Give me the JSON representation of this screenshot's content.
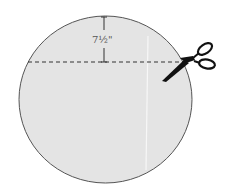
{
  "diagram": {
    "title_fragment": "",
    "measurement_label": "7½\"",
    "shape": "circle",
    "fill_color": "#e4e4e4",
    "outline_color": "#555555",
    "cut_line": "dashed",
    "tool_icon": "scissors-icon"
  }
}
